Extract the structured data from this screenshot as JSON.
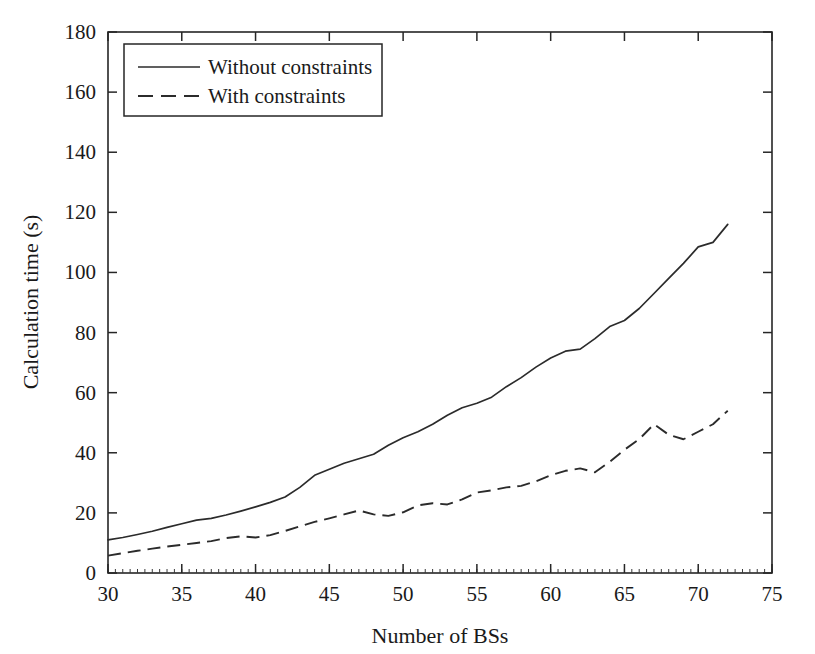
{
  "chart_data": {
    "type": "line",
    "title": "",
    "xlabel": "Number of BSs",
    "ylabel": "Calculation time (s)",
    "xlim": [
      30,
      75
    ],
    "ylim": [
      0,
      180
    ],
    "xticks": [
      30,
      35,
      40,
      45,
      50,
      55,
      60,
      65,
      70,
      75
    ],
    "yticks": [
      0,
      20,
      40,
      60,
      80,
      100,
      120,
      140,
      160,
      180
    ],
    "grid": false,
    "legend_position": "top-left",
    "line_color": "#2b2b2b",
    "x": [
      30,
      31,
      32,
      33,
      34,
      35,
      36,
      37,
      38,
      39,
      40,
      41,
      42,
      43,
      44,
      45,
      46,
      47,
      48,
      49,
      50,
      51,
      52,
      53,
      54,
      55,
      56,
      57,
      58,
      59,
      60,
      61,
      62,
      63,
      64,
      65,
      66,
      67,
      68,
      69,
      70,
      71,
      72
    ],
    "series": [
      {
        "name": "Without constraints",
        "style": "solid",
        "values": [
          11,
          11.8,
          12.8,
          13.9,
          15.2,
          16.4,
          17.6,
          18.2,
          19.3,
          20.6,
          22,
          23.5,
          25.3,
          28.5,
          32.5,
          34.5,
          36.5,
          38,
          39.5,
          42.5,
          45,
          47,
          49.5,
          52.5,
          55,
          56.5,
          58.5,
          62,
          65,
          68.5,
          71.5,
          73.8,
          74.5,
          78,
          82,
          84,
          88,
          93,
          98,
          103,
          108.5,
          110,
          116
        ]
      },
      {
        "name": "With constraints",
        "style": "dashed",
        "values": [
          5.8,
          6.6,
          7.4,
          8.1,
          8.8,
          9.4,
          10,
          10.6,
          11.6,
          12.2,
          11.8,
          12.6,
          14,
          15.5,
          17,
          18.2,
          19.5,
          20.8,
          19.5,
          19,
          20.2,
          22.5,
          23.2,
          22.8,
          24.5,
          26.8,
          27.5,
          28.5,
          29,
          30.5,
          32.5,
          34,
          34.8,
          33.5,
          37,
          41,
          44.5,
          49.5,
          46,
          44.5,
          47,
          49.5,
          54
        ]
      }
    ],
    "series_full": [
      {
        "name": "Without constraints",
        "points_xy": [
          [
            30,
            11
          ],
          [
            31,
            11.8
          ],
          [
            32,
            12.8
          ],
          [
            33,
            13.9
          ],
          [
            34,
            15.2
          ],
          [
            35,
            16.4
          ],
          [
            36,
            17.6
          ],
          [
            37,
            18.2
          ],
          [
            38,
            19.3
          ],
          [
            39,
            20.6
          ],
          [
            40,
            22
          ],
          [
            41,
            23.5
          ],
          [
            42,
            25.3
          ],
          [
            43,
            28.5
          ],
          [
            44,
            32.5
          ],
          [
            45,
            34.5
          ],
          [
            46,
            36.5
          ],
          [
            47,
            38
          ],
          [
            48,
            39.5
          ],
          [
            49,
            42.5
          ],
          [
            50,
            45
          ],
          [
            51,
            47
          ],
          [
            52,
            49.5
          ],
          [
            53,
            52.5
          ],
          [
            54,
            55
          ],
          [
            55,
            56.5
          ],
          [
            56,
            58.5
          ],
          [
            57,
            62
          ],
          [
            58,
            65
          ],
          [
            59,
            68.5
          ],
          [
            60,
            71.5
          ],
          [
            61,
            73.8
          ],
          [
            62,
            74.5
          ],
          [
            63,
            78
          ],
          [
            64,
            82
          ],
          [
            65,
            84
          ],
          [
            66,
            88
          ],
          [
            67,
            93
          ],
          [
            68,
            98
          ],
          [
            69,
            103
          ],
          [
            70,
            108.5
          ],
          [
            71,
            110
          ],
          [
            72,
            116
          ]
        ]
      }
    ]
  },
  "axes": {
    "x_title": "Number of BSs",
    "y_title": "Calculation time (s)",
    "x_tick_labels": [
      "30",
      "35",
      "40",
      "45",
      "50",
      "55",
      "60",
      "65",
      "70",
      "75"
    ],
    "y_tick_labels": [
      "0",
      "20",
      "40",
      "60",
      "80",
      "100",
      "120",
      "140",
      "160",
      "180"
    ]
  },
  "legend": {
    "entries": [
      {
        "label": "Without constraints",
        "style": "solid"
      },
      {
        "label": "With constraints",
        "style": "dashed"
      }
    ]
  }
}
